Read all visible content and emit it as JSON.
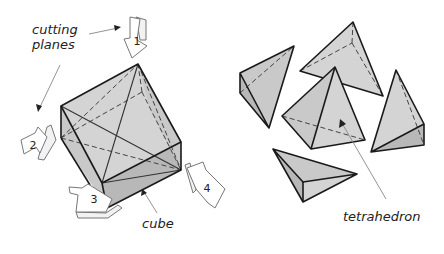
{
  "diagram": {
    "labels": {
      "cutting_planes_line1": "cutting",
      "cutting_planes_line2": "planes",
      "cube": "cube",
      "tetrahedron": "tetrahedron"
    },
    "plane_arrows": [
      {
        "number": "1"
      },
      {
        "number": "2"
      },
      {
        "number": "3"
      },
      {
        "number": "4"
      }
    ],
    "colors": {
      "face_light": "#d4d4d4",
      "face_mid": "#c9c9c9",
      "face_dark": "#b8b8b8",
      "edge": "#1a1a1a"
    }
  }
}
